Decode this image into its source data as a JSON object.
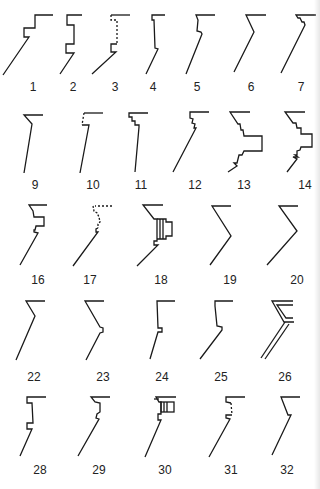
{
  "diagram": {
    "type": "profile-catalog",
    "stroke_color": "#1a1a1a",
    "background": "#ffffff",
    "figures": [
      {
        "id": "1",
        "label": "1",
        "x": 12,
        "y": 12,
        "lx": 33,
        "ly": 79
      },
      {
        "id": "2",
        "label": "2",
        "x": 58,
        "y": 12,
        "lx": 73,
        "ly": 79
      },
      {
        "id": "3",
        "label": "3",
        "x": 90,
        "y": 12,
        "lx": 115,
        "ly": 79
      },
      {
        "id": "4",
        "label": "4",
        "x": 144,
        "y": 12,
        "lx": 153,
        "ly": 79
      },
      {
        "id": "5",
        "label": "5",
        "x": 186,
        "y": 12,
        "lx": 197,
        "ly": 79
      },
      {
        "id": "6",
        "label": "6",
        "x": 232,
        "y": 12,
        "lx": 251,
        "ly": 79
      },
      {
        "id": "7",
        "label": "7",
        "x": 280,
        "y": 12,
        "lx": 301,
        "ly": 79
      },
      {
        "id": "9",
        "label": "9",
        "x": 22,
        "y": 112,
        "lx": 35,
        "ly": 177
      },
      {
        "id": "10",
        "label": "10",
        "x": 78,
        "y": 112,
        "lx": 93,
        "ly": 177
      },
      {
        "id": "11",
        "label": "11",
        "x": 126,
        "y": 112,
        "lx": 141,
        "ly": 177
      },
      {
        "id": "12",
        "label": "12",
        "x": 170,
        "y": 110,
        "lx": 195,
        "ly": 177
      },
      {
        "id": "13",
        "label": "13",
        "x": 228,
        "y": 110,
        "lx": 244,
        "ly": 177
      },
      {
        "id": "14",
        "label": "14",
        "x": 284,
        "y": 110,
        "lx": 305,
        "ly": 177
      },
      {
        "id": "16",
        "label": "16",
        "x": 18,
        "y": 203,
        "lx": 38,
        "ly": 272
      },
      {
        "id": "17",
        "label": "17",
        "x": 72,
        "y": 203,
        "lx": 90,
        "ly": 272
      },
      {
        "id": "18",
        "label": "18",
        "x": 136,
        "y": 203,
        "lx": 161,
        "ly": 272
      },
      {
        "id": "19",
        "label": "19",
        "x": 206,
        "y": 205,
        "lx": 230,
        "ly": 272
      },
      {
        "id": "20",
        "label": "20",
        "x": 266,
        "y": 205,
        "lx": 297,
        "ly": 272
      },
      {
        "id": "22",
        "label": "22",
        "x": 16,
        "y": 300,
        "lx": 34,
        "ly": 369
      },
      {
        "id": "23",
        "label": "23",
        "x": 84,
        "y": 300,
        "lx": 103,
        "ly": 369
      },
      {
        "id": "24",
        "label": "24",
        "x": 150,
        "y": 300,
        "lx": 162,
        "ly": 369
      },
      {
        "id": "25",
        "label": "25",
        "x": 200,
        "y": 300,
        "lx": 221,
        "ly": 369
      },
      {
        "id": "26",
        "label": "26",
        "x": 260,
        "y": 300,
        "lx": 285,
        "ly": 369
      },
      {
        "id": "28",
        "label": "28",
        "x": 20,
        "y": 396,
        "lx": 40,
        "ly": 462
      },
      {
        "id": "29",
        "label": "29",
        "x": 78,
        "y": 396,
        "lx": 99,
        "ly": 462
      },
      {
        "id": "30",
        "label": "30",
        "x": 146,
        "y": 396,
        "lx": 165,
        "ly": 462
      },
      {
        "id": "31",
        "label": "31",
        "x": 208,
        "y": 396,
        "lx": 231,
        "ly": 462
      },
      {
        "id": "32",
        "label": "32",
        "x": 272,
        "y": 396,
        "lx": 287,
        "ly": 462
      }
    ]
  }
}
